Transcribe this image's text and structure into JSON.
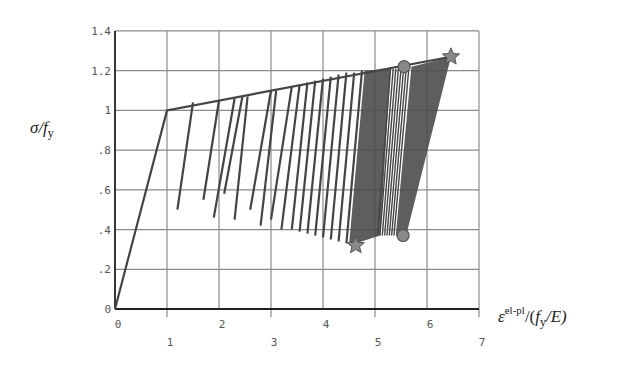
{
  "chart_data": {
    "type": "line",
    "title": "",
    "xlabel": "ε^{el-pl}/(f_y/E)",
    "ylabel": "σ/f_y",
    "xlim": [
      0,
      7
    ],
    "ylim": [
      0,
      1.4
    ],
    "grid": true,
    "legend": null,
    "x_ticks": [
      "0",
      "1",
      "2",
      "3",
      "4",
      "5",
      "6",
      "7"
    ],
    "y_ticks": [
      "0",
      ".2",
      ".4",
      ".6",
      ".8",
      "1",
      "1.2",
      "1.4"
    ],
    "backbone": {
      "name": "elastic-hardening envelope",
      "x": [
        0,
        1,
        6.46
      ],
      "y": [
        0,
        1.0,
        1.27
      ]
    },
    "unloading_lines": [
      {
        "x": [
          1.5,
          1.2
        ],
        "y": [
          1.04,
          0.5
        ]
      },
      {
        "x": [
          2.0,
          1.7
        ],
        "y": [
          1.05,
          0.55
        ]
      },
      {
        "x": [
          2.3,
          1.9
        ],
        "y": [
          1.06,
          0.46
        ]
      },
      {
        "x": [
          2.45,
          2.1
        ],
        "y": [
          1.07,
          0.58
        ]
      },
      {
        "x": [
          2.55,
          2.3
        ],
        "y": [
          1.07,
          0.45
        ]
      },
      {
        "x": [
          3.0,
          2.6
        ],
        "y": [
          1.1,
          0.5
        ]
      },
      {
        "x": [
          3.1,
          2.8
        ],
        "y": [
          1.1,
          0.42
        ]
      },
      {
        "x": [
          3.4,
          3.0
        ],
        "y": [
          1.12,
          0.45
        ]
      },
      {
        "x": [
          3.55,
          3.2
        ],
        "y": [
          1.13,
          0.4
        ]
      },
      {
        "x": [
          3.7,
          3.4
        ],
        "y": [
          1.14,
          0.4
        ]
      },
      {
        "x": [
          3.85,
          3.55
        ],
        "y": [
          1.15,
          0.39
        ]
      },
      {
        "x": [
          4.0,
          3.7
        ],
        "y": [
          1.16,
          0.38
        ]
      },
      {
        "x": [
          4.15,
          3.85
        ],
        "y": [
          1.17,
          0.37
        ]
      },
      {
        "x": [
          4.3,
          4.0
        ],
        "y": [
          1.18,
          0.36
        ]
      },
      {
        "x": [
          4.45,
          4.15
        ],
        "y": [
          1.19,
          0.35
        ]
      },
      {
        "x": [
          4.6,
          4.3
        ],
        "y": [
          1.19,
          0.34
        ]
      },
      {
        "x": [
          4.75,
          4.45
        ],
        "y": [
          1.2,
          0.33
        ]
      }
    ],
    "dense_band_1": {
      "x_top": [
        4.8,
        5.3
      ],
      "x_bottom": [
        4.5,
        5.1
      ],
      "y_top": [
        1.2,
        1.21
      ],
      "y_bottom": [
        0.32,
        0.37
      ]
    },
    "dense_band_2": {
      "x_top": [
        5.7,
        6.46
      ],
      "x_bottom": [
        5.4,
        5.6
      ],
      "y_top": [
        1.22,
        1.27
      ],
      "y_bottom": [
        0.37,
        0.37
      ]
    },
    "markers": [
      {
        "shape": "star",
        "x": 4.63,
        "y": 0.32
      },
      {
        "shape": "circle",
        "x": 5.54,
        "y": 0.37
      },
      {
        "shape": "circle",
        "x": 5.56,
        "y": 1.22
      },
      {
        "shape": "star",
        "x": 6.46,
        "y": 1.27
      }
    ]
  },
  "labels": {
    "ylabel_main": "σ/",
    "ylabel_f": "f",
    "ylabel_sub": "y",
    "xlabel_eps": "ε",
    "xlabel_sup": "el-pl",
    "xlabel_rest1": "/(",
    "xlabel_f": "f",
    "xlabel_sub": "y",
    "xlabel_rest2": "/E)"
  },
  "colors": {
    "grid": "#8a8a8a",
    "axis": "#222222",
    "curve": "#444444",
    "band": "#4d4d4d",
    "marker_fill": "#888888",
    "marker_stroke": "#555555"
  }
}
